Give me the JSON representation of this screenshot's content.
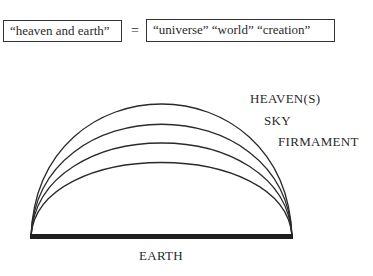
{
  "equation": {
    "left_term": "“heaven and earth”",
    "operator": "=",
    "right_term": "“universe” “world” “creation”"
  },
  "diagram": {
    "arcs": [
      {
        "label": "HEAVEN(S)",
        "apex_y": 62
      },
      {
        "label": "SKY",
        "apex_y": 82
      },
      {
        "label": "FIRMAMENT",
        "apex_y": 101
      },
      {
        "label": "",
        "apex_y": 121
      }
    ],
    "base": {
      "label": "EARTH"
    },
    "colors": {
      "stroke": "#2a2a2a",
      "base": "#1e1e1e"
    }
  }
}
